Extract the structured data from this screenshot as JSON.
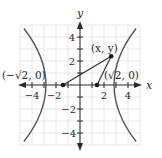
{
  "diagram": {
    "axes": {
      "x_label": "x",
      "y_label": "y",
      "range": [
        -5,
        5
      ],
      "x_ticks": [
        {
          "value": -4,
          "label": "−4"
        },
        {
          "value": -2,
          "label": "−2"
        },
        {
          "value": 2,
          "label": "2"
        },
        {
          "value": 4,
          "label": "4"
        }
      ],
      "y_ticks": [
        {
          "value": 4,
          "label": "4"
        },
        {
          "value": 2,
          "label": "2"
        },
        {
          "value": -2,
          "label": "−2"
        },
        {
          "value": -4,
          "label": "−4"
        }
      ],
      "minor_ticks": [
        -5,
        -4,
        -3,
        -2,
        -1,
        1,
        2,
        3,
        4,
        5
      ]
    },
    "curve": {
      "equation": "x^2 - y^2 = 1",
      "vertices": [
        [
          -1,
          0
        ],
        [
          1,
          0
        ]
      ],
      "color": "#555555"
    },
    "points": {
      "left_focus": {
        "label": "(−√2, 0)",
        "x": -1.414,
        "y": 0
      },
      "right_focus": {
        "label": "(√2, 0)",
        "x": 1.414,
        "y": 0
      },
      "point_on_curve": {
        "label": "(x, y)",
        "x": 2.6,
        "y": 2.4
      }
    },
    "colors": {
      "axis": "#2a2a2a",
      "grid": "#e2e2e2",
      "curve": "#555555"
    }
  }
}
